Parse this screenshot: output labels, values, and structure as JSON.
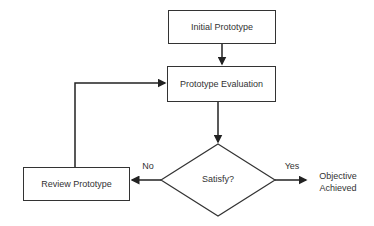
{
  "diagram": {
    "nodes": {
      "initial": {
        "label": "Initial Prototype",
        "shape": "rectangle"
      },
      "evaluation": {
        "label": "Prototype Evaluation",
        "shape": "rectangle"
      },
      "decision": {
        "label": "Satisfy?",
        "shape": "diamond"
      },
      "review": {
        "label": "Review Prototype",
        "shape": "rectangle"
      },
      "objective": {
        "label_line1": "Objective",
        "label_line2": "Achieved",
        "shape": "text"
      }
    },
    "edges": [
      {
        "from": "initial",
        "to": "evaluation",
        "label": ""
      },
      {
        "from": "evaluation",
        "to": "decision",
        "label": ""
      },
      {
        "from": "decision",
        "to": "review",
        "label": "No"
      },
      {
        "from": "decision",
        "to": "objective",
        "label": "Yes"
      },
      {
        "from": "review",
        "to": "evaluation",
        "label": ""
      }
    ],
    "edge_labels": {
      "no": "No",
      "yes": "Yes"
    }
  }
}
